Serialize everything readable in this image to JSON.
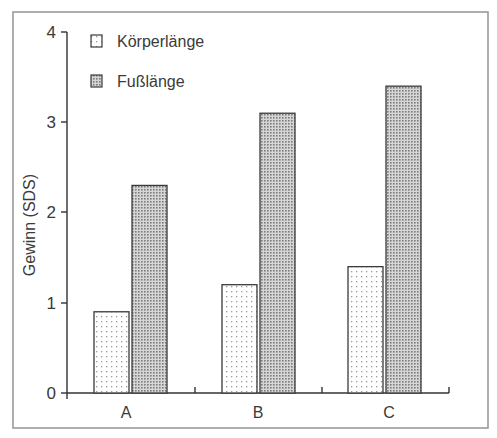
{
  "chart_data": {
    "type": "bar",
    "title": "",
    "xlabel": "",
    "ylabel": "Gewinn (SDS)",
    "categories": [
      "A",
      "B",
      "C"
    ],
    "series": [
      {
        "name": "Körperlänge",
        "values": [
          0.9,
          1.2,
          1.4
        ],
        "pattern": "sparse-dots",
        "color": "#f4f4f4"
      },
      {
        "name": "Fußlänge",
        "values": [
          2.3,
          3.1,
          3.4
        ],
        "pattern": "dense-dots",
        "color": "#b8b8b8"
      }
    ],
    "ylim": [
      0,
      4
    ],
    "yticks": [
      "0",
      "1",
      "2",
      "3",
      "4"
    ],
    "grid": false,
    "legend_position": "top-left-inside"
  },
  "legend": {
    "items": [
      {
        "label": "Körperlänge"
      },
      {
        "label": "Fußlänge"
      }
    ]
  },
  "axis": {
    "y_title": "Gewinn (SDS)"
  }
}
